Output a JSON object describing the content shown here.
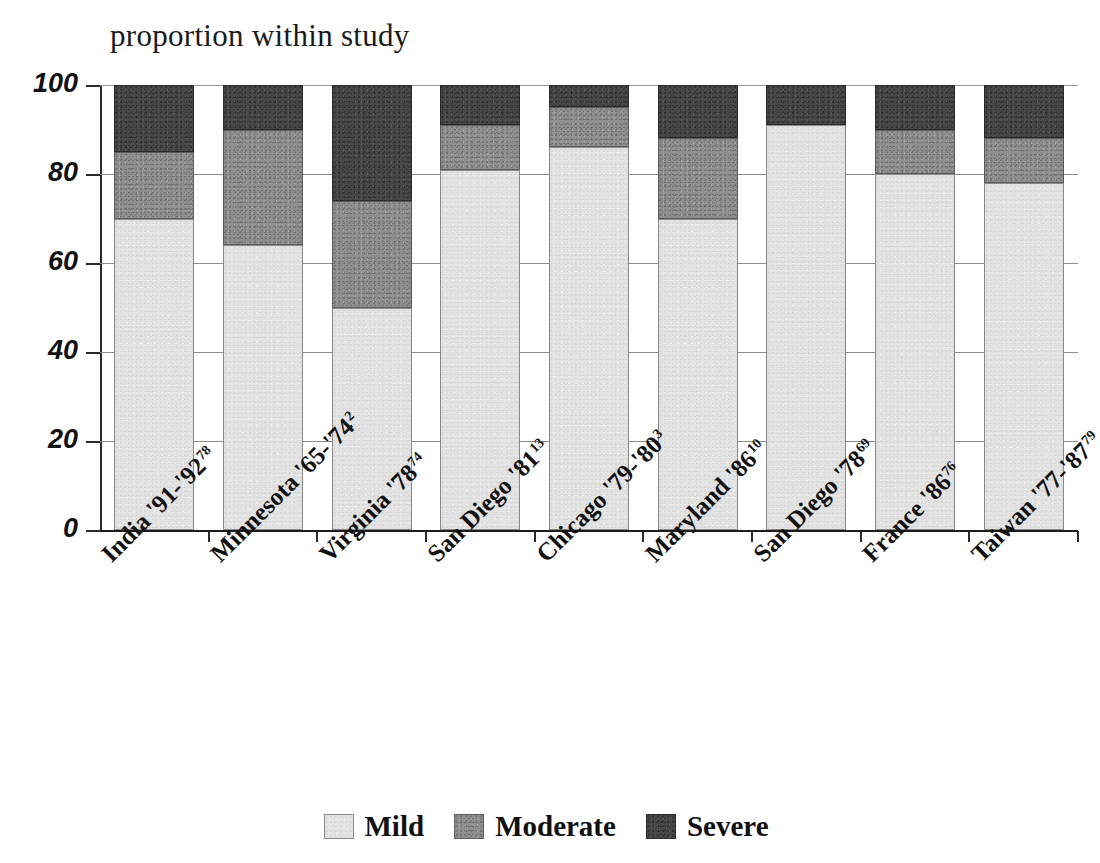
{
  "chart_data": {
    "type": "bar",
    "subtype": "stacked-bar-100-percent",
    "title": "proportion within study",
    "xlabel": "",
    "ylabel": "",
    "ylim": [
      0,
      100
    ],
    "yticks": [
      0,
      20,
      40,
      60,
      80,
      100
    ],
    "ytick_labels": [
      "0",
      "20",
      "40",
      "60",
      "80",
      "100"
    ],
    "grid": true,
    "legend_position": "bottom",
    "categories": [
      "India '91-'92",
      "Minnesota '65-'74",
      "Virginia '78",
      "San Diego '81",
      "Chicago '79-'80",
      "Maryland '86",
      "San Diego '78",
      "France '86",
      "Taiwan '77-'87"
    ],
    "category_references": [
      "78",
      "2",
      "74",
      "13",
      "3",
      "10",
      "69",
      "76",
      "79"
    ],
    "series": [
      {
        "name": "Mild",
        "color": "#e3e3e3",
        "values": [
          70,
          64,
          50,
          81,
          86,
          70,
          91,
          80,
          78
        ]
      },
      {
        "name": "Moderate",
        "color": "#8f8f8f",
        "values": [
          15,
          26,
          24,
          10,
          9,
          18,
          0,
          10,
          10
        ]
      },
      {
        "name": "Severe",
        "color": "#474747",
        "values": [
          15,
          10,
          26,
          9,
          5,
          12,
          9,
          10,
          12
        ]
      }
    ]
  },
  "legend": {
    "items": [
      {
        "label": "Mild"
      },
      {
        "label": "Moderate"
      },
      {
        "label": "Severe"
      }
    ]
  }
}
